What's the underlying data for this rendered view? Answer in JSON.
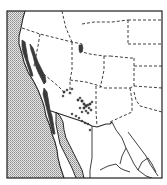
{
  "map": {
    "subject": "Species distribution range map, western North America",
    "region": "Western United States and northwestern Mexico",
    "legend": [],
    "colors": {
      "background": "#ffffff",
      "ocean_stipple": "#bdbdbd",
      "land": "#ffffff",
      "borders": "#2a2a2a",
      "range": "#3a3a3a"
    },
    "features": {
      "ocean": "Pacific Ocean (stippled)",
      "state_boundaries": "dashed lines",
      "international_boundary": "solid line (US–Mexico)",
      "range_areas": [
        "California coastal ranges and Sierra Nevada",
        "Southern California / Baja coast",
        "Arizona Mogollon Rim region",
        "Isolated population in northern Utah / Wyoming"
      ]
    }
  }
}
